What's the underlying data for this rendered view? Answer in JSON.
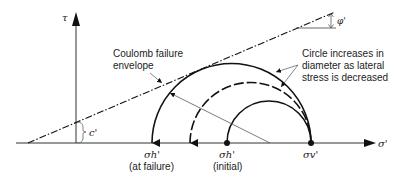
{
  "diagram": {
    "axes": {
      "y_label": "τ",
      "x_label": "σ'"
    },
    "labels": {
      "envelope_line1": "Coulomb failure",
      "envelope_line2": "envelope",
      "circle_note_line1": "Circle increases in",
      "circle_note_line2": "diameter as lateral",
      "circle_note_line3": "stress is decreased",
      "cohesion": "c'",
      "friction_angle": "φ'",
      "sigma_h_failure": "σh'",
      "sigma_h_failure_note": "(at failure)",
      "sigma_h_initial": "σh'",
      "sigma_h_initial_note": "(initial)",
      "sigma_v": "σv'"
    },
    "colors": {
      "line": "#111111",
      "thin": "#555555",
      "background": "#ffffff"
    }
  }
}
